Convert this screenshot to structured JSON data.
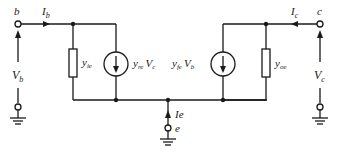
{
  "diagram": {
    "terminals": {
      "base": {
        "label": "b"
      },
      "collector": {
        "label": "c"
      },
      "emitter": {
        "label": "e"
      }
    },
    "currents": {
      "base": {
        "label": "I",
        "sub": "b"
      },
      "collector": {
        "label": "I",
        "sub": "c"
      },
      "emitter": {
        "label": "Ie"
      }
    },
    "voltages": {
      "base": {
        "label": "V",
        "sub": "b"
      },
      "collector": {
        "label": "V",
        "sub": "c"
      }
    },
    "components": {
      "input_admittance": {
        "label": "y",
        "sub": "ie"
      },
      "reverse_source": {
        "label": "y",
        "sub": "re",
        "ctrl": "V",
        "ctrl_sub": "c"
      },
      "forward_source": {
        "label": "y",
        "sub": "fe",
        "ctrl": "V",
        "ctrl_sub": "b"
      },
      "output_admittance": {
        "label": "y",
        "sub": "oe"
      }
    },
    "colors": {
      "line": "#1a1a1a",
      "background": "#ffffff"
    }
  }
}
